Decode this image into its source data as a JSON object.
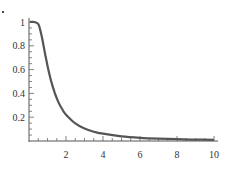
{
  "chart_data": {
    "type": "line",
    "title": "",
    "xlabel": "",
    "ylabel": "",
    "xlim": [
      0,
      10
    ],
    "ylim": [
      0,
      1
    ],
    "grid": false,
    "legend": null,
    "x_ticks": [
      2,
      4,
      6,
      8,
      10
    ],
    "x_tick_labels": [
      "2",
      "4",
      "6",
      "8",
      "10"
    ],
    "y_ticks": [
      0.2,
      0.4,
      0.6,
      0.8,
      1
    ],
    "y_tick_labels": [
      "0.2",
      "0.4",
      "0.6",
      "0.8",
      "1"
    ],
    "x_minor_step": 0.5,
    "y_minor_step": 0.05,
    "line_color": "#555555",
    "series": [
      {
        "name": "f(x)",
        "x": [
          0.05,
          0.3,
          0.5,
          0.6,
          0.7,
          0.8,
          0.9,
          1.0,
          1.1,
          1.2,
          1.4,
          1.6,
          1.8,
          2.0,
          2.5,
          3.0,
          3.5,
          4.0,
          5.0,
          6.0,
          7.0,
          8.0,
          9.0,
          10.0
        ],
        "values": [
          1.0,
          1.0,
          0.982,
          0.938,
          0.87,
          0.79,
          0.709,
          0.632,
          0.562,
          0.501,
          0.4,
          0.323,
          0.266,
          0.221,
          0.148,
          0.105,
          0.078,
          0.061,
          0.039,
          0.027,
          0.02,
          0.016,
          0.012,
          0.01
        ]
      }
    ]
  }
}
